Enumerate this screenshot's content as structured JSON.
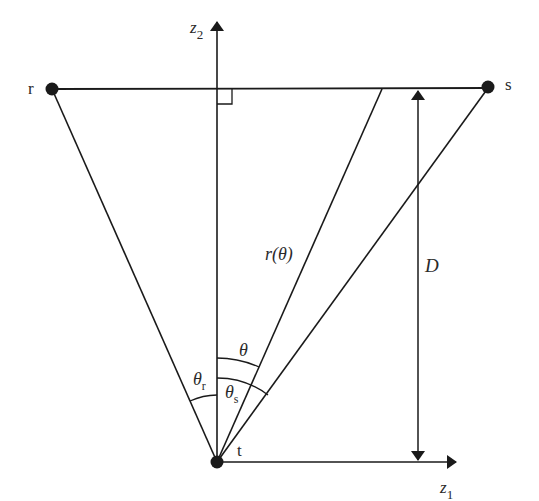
{
  "diagram": {
    "type": "geometry",
    "points": {
      "r": {
        "label": "r"
      },
      "s": {
        "label": "s"
      },
      "t": {
        "label": "t"
      }
    },
    "axes": {
      "z1": {
        "base": "z",
        "sub": "1"
      },
      "z2": {
        "base": "z",
        "sub": "2"
      }
    },
    "labels": {
      "r_theta": "r(θ)",
      "D": "D",
      "theta": "θ",
      "theta_r": {
        "base": "θ",
        "sub": "r"
      },
      "theta_s": {
        "base": "θ",
        "sub": "s"
      }
    },
    "colors": {
      "line": "#1a1a1a",
      "text": "#2a2a2a",
      "background": "#ffffff"
    }
  }
}
